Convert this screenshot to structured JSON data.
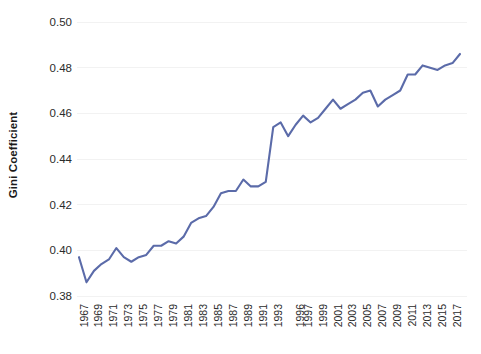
{
  "chart_data": {
    "type": "line",
    "title": "",
    "subtitle": "",
    "xlabel": "",
    "ylabel": "Gini Coefficient",
    "ylim": [
      0.38,
      0.5
    ],
    "yticks": [
      "0.38",
      "0.40",
      "0.42",
      "0.44",
      "0.46",
      "0.48",
      "0.50"
    ],
    "ytick_values": [
      0.38,
      0.4,
      0.42,
      0.44,
      0.46,
      0.48,
      0.5
    ],
    "grid": "horizontal",
    "legend": "none",
    "series_color": "#5b6ba9",
    "x": [
      "1967",
      "1968",
      "1969",
      "1970",
      "1971",
      "1972",
      "1973",
      "1974",
      "1975",
      "1976",
      "1977",
      "1978",
      "1979",
      "1980",
      "1981",
      "1982",
      "1983",
      "1984",
      "1985",
      "1986",
      "1987",
      "1988",
      "1989",
      "1990",
      "1991",
      "1992",
      "1993",
      "1994",
      "1995",
      "1996",
      "1997",
      "1998",
      "1999",
      "2000",
      "2001",
      "2002",
      "2003",
      "2004",
      "2005",
      "2006",
      "2007",
      "2008",
      "2009",
      "2010",
      "2011",
      "2012",
      "2013",
      "2014",
      "2015",
      "2016",
      "2017",
      "2018"
    ],
    "xtick_labels": [
      "1967",
      "1969",
      "1971",
      "1973",
      "1975",
      "1977",
      "1979",
      "1981",
      "1983",
      "1985",
      "1987",
      "1989",
      "1991",
      "1993",
      "1996",
      "1997",
      "1999",
      "2001",
      "2003",
      "2005",
      "2007",
      "2009",
      "2011",
      "2013",
      "2015",
      "2017"
    ],
    "series": [
      {
        "name": "Gini Coefficient",
        "values": [
          0.397,
          0.386,
          0.391,
          0.394,
          0.396,
          0.401,
          0.397,
          0.395,
          0.397,
          0.398,
          0.402,
          0.402,
          0.404,
          0.403,
          0.406,
          0.412,
          0.414,
          0.415,
          0.419,
          0.425,
          0.426,
          0.426,
          0.431,
          0.428,
          0.428,
          0.43,
          0.454,
          0.456,
          0.45,
          0.455,
          0.459,
          0.456,
          0.458,
          0.462,
          0.466,
          0.462,
          0.464,
          0.466,
          0.469,
          0.47,
          0.463,
          0.466,
          0.468,
          0.47,
          0.477,
          0.477,
          0.481,
          0.48,
          0.479,
          0.481,
          0.482,
          0.486
        ]
      }
    ]
  },
  "axis": {
    "y_title": "Gini Coefficient"
  }
}
